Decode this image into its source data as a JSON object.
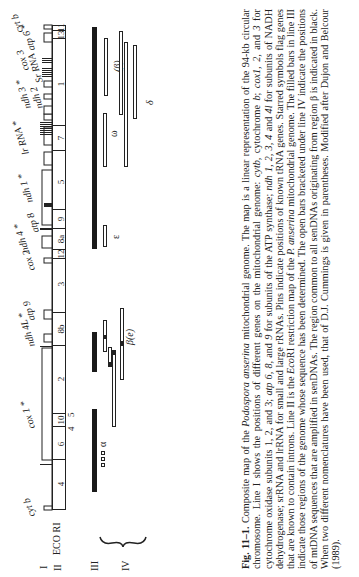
{
  "figure": {
    "line_labels": [
      "I",
      "II",
      "III",
      "IV"
    ],
    "ecori_label": "ECO RI",
    "genes": [
      {
        "name": "cyt b",
        "starred": false,
        "pos": 70
      },
      {
        "name": "cox 1",
        "starred": true,
        "pos": 160
      },
      {
        "name": "ndh 4L",
        "starred": true,
        "pos": 255
      },
      {
        "name": "atp 9",
        "starred": false,
        "pos": 275
      },
      {
        "name": "cox 2",
        "starred": false,
        "pos": 315
      },
      {
        "name": "ndh 4",
        "starred": true,
        "pos": 345
      },
      {
        "name": "atp 8",
        "starred": false,
        "pos": 360
      },
      {
        "name": "ndh 1",
        "starred": true,
        "pos": 385
      },
      {
        "name": "lr RNA",
        "starred": true,
        "pos": 440
      },
      {
        "name": "ndh 2",
        "starred": false,
        "pos": 477
      },
      {
        "name": "ndh 3",
        "starred": true,
        "pos": 487
      },
      {
        "name": "Sr RNA",
        "starred": false,
        "pos": 505
      },
      {
        "name": "cox 3",
        "starred": false,
        "pos": 517
      },
      {
        "name": "atp 6",
        "starred": true,
        "pos": 532
      },
      {
        "name": "cyt b",
        "starred": false,
        "pos": 552
      }
    ],
    "ecori_fragments": [
      {
        "label": "4",
        "start": 67,
        "end": 116
      },
      {
        "label": "6",
        "start": 116,
        "end": 149
      },
      {
        "label": "10",
        "start": 149,
        "end": 162
      },
      {
        "label": "2",
        "start": 162,
        "end": 230
      },
      {
        "label": "8b",
        "start": 230,
        "end": 263
      },
      {
        "label": "3",
        "start": 263,
        "end": 317
      },
      {
        "label": "12",
        "start": 317,
        "end": 326
      },
      {
        "label": "8a",
        "start": 326,
        "end": 347
      },
      {
        "label": "9",
        "start": 347,
        "end": 366
      },
      {
        "label": "5",
        "start": 366,
        "end": 425
      },
      {
        "label": "7",
        "start": 425,
        "end": 450
      },
      {
        "label": "1",
        "start": 450,
        "end": 537
      },
      {
        "label": "13",
        "start": 537,
        "end": 545
      },
      {
        "label": "11",
        "start": 545,
        "end": 552
      }
    ],
    "ecori_small_labels": [
      "4",
      "5"
    ],
    "line3_bars": [
      {
        "start": 85,
        "end": 168
      },
      {
        "start": 205,
        "end": 245
      },
      {
        "start": 328,
        "end": 550
      }
    ],
    "line4_labels": {
      "alpha": "α",
      "beta_e": "β(e)",
      "epsilon": "ε",
      "omega": "ω",
      "beta_paren": "(β)",
      "delta": "δ"
    }
  },
  "caption": {
    "fig_label": "Fig. 11–1.",
    "text_1": " Composite map of the ",
    "species_1": "Podospora anserina",
    "text_2": " mitochondrial genome. The map is a linear representation of the 94-kb circular chromosome. Line I shows the positions of different genes on the mitochondrial genome: ",
    "g_cyt": "cytb,",
    "text_3": " cytochrome ",
    "g_b": "b",
    "text_4": "; ",
    "g_cox": "cox1, 2,",
    "text_5": " and ",
    "g_3": "3",
    "text_6": " for cytochrome oxidase subunits 1, 2, and 3; ",
    "g_atp": "atp 6, 8,",
    "text_7": " and ",
    "g_9": "9",
    "text_8": " for subunits of the ATP synthase; ",
    "g_ndh": "ndh 1, 2, 3, 4",
    "text_9": " and ",
    "g_4l": "4l",
    "text_10": " for subunits of NADH dehydrogenase; srRNA and lrRNA for small and large rRNAs. Pins indicate positions of known tRNA genes. Starred symbols flag genes that are known to contain introns. Line II is the ",
    "g_eco": "Eco",
    "text_11": "RI restriction map of the ",
    "species_2": "P. anserina",
    "text_12": " mitochondrial genome. The filled bars in line III indicate those regions of the genome whose sequence has been determined. The open bars bracketed under line IV indicate the positions of mtDNA sequences that are amplified in senDNAs. The region common to all senDNAs originating from region β is indicated in black. When two different nomenclatures have been used, that of D.J. Cummings is given in parentheses. Modified after Dujon and Belcour (1989)."
  }
}
